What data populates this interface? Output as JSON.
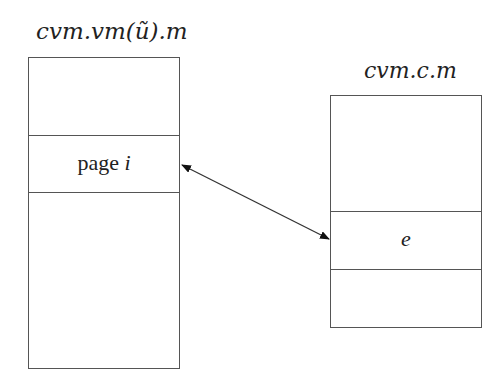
{
  "diagram": {
    "left": {
      "title": "cvm.vm(ũ).m",
      "cell_label": "page",
      "cell_var": "i"
    },
    "right": {
      "title": "cvm.c.m",
      "cell_var": "e"
    },
    "arrow": {
      "type": "bidirectional",
      "from": "page i",
      "to": "e"
    }
  }
}
